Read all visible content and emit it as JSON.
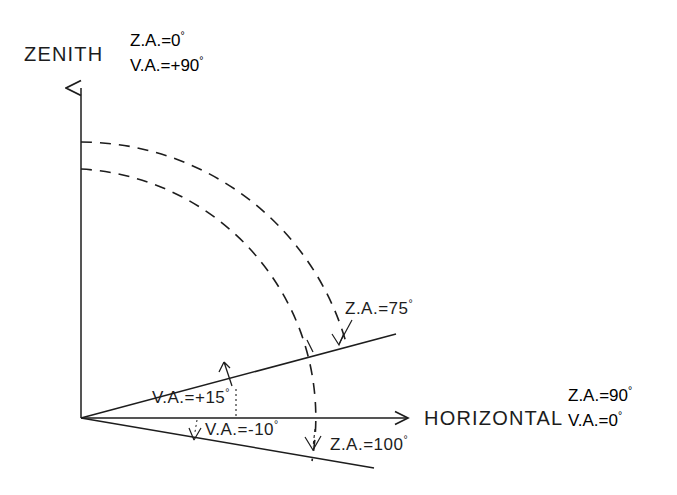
{
  "figure": {
    "type": "angle-convention-diagram",
    "background": "#ffffff",
    "ink_color": "#1d1d1d",
    "width": 677,
    "height": 495
  },
  "axes": {
    "vertical": {
      "label": "ZENITH",
      "annotations": [
        "Z.A.=0°",
        "V.A.=+90°"
      ],
      "zenith_angle": "0°",
      "vertical_angle": "+90°"
    },
    "horizontal": {
      "label": "HORIZONTAL",
      "annotations": [
        "Z.A.=90°",
        "V.A.=0°"
      ],
      "zenith_angle": "90°",
      "vertical_angle": "0°"
    }
  },
  "rays": [
    {
      "name": "upper-ray",
      "vertical_angle_label": "V.A.=+15°",
      "zenith_angle_label": "Z.A.=75°",
      "vertical_angle_deg": 15,
      "zenith_angle_deg": 75,
      "direction": "above-horizontal"
    },
    {
      "name": "lower-ray",
      "vertical_angle_label": "V.A.=-10°",
      "zenith_angle_label": "Z.A.=100°",
      "vertical_angle_deg": -10,
      "zenith_angle_deg": 100,
      "direction": "below-horizontal"
    }
  ],
  "arcs": [
    {
      "name": "outer-arc",
      "style": "dashed",
      "sweep": "zenith-to-upper-ray",
      "terminates_at": "Z.A.=75°"
    },
    {
      "name": "inner-arc",
      "style": "dashed",
      "sweep": "zenith-to-lower-ray",
      "terminates_at": "Z.A.=100°"
    }
  ],
  "labels": {
    "zenith": "ZENITH",
    "horizontal": "HORIZONTAL",
    "za_zenith": "Z.A.=0",
    "va_zenith": "V.A.=+90",
    "za_horizontal": "Z.A.=90",
    "va_horizontal": "V.A.=0",
    "za_upper": "Z.A.=75",
    "va_upper": "V.A.=+15",
    "za_lower": "Z.A.=100",
    "va_lower": "V.A.=-10",
    "degree": "°"
  }
}
